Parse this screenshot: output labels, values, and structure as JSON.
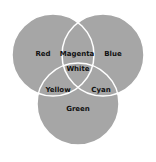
{
  "diagram": {
    "type": "venn",
    "fill_color": "#a6a6a6",
    "outline_color": "#ffffff",
    "circles": [
      {
        "name": "Red",
        "cx": 53,
        "cy": 55,
        "r": 41
      },
      {
        "name": "Blue",
        "cx": 103,
        "cy": 55,
        "r": 41
      },
      {
        "name": "Green",
        "cx": 78,
        "cy": 104,
        "r": 41
      }
    ],
    "labels": {
      "red": "Red",
      "blue": "Blue",
      "green": "Green",
      "magenta": "Magenta",
      "yellow": "Yellow",
      "cyan": "Cyan",
      "white": "White"
    }
  }
}
